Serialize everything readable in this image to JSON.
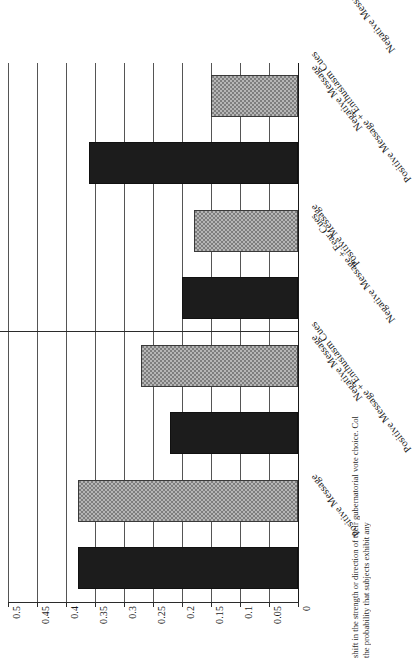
{
  "figure": {
    "caption_fragment_top": "shift in the strength or direction of their gubernatorial vote choice. Col",
    "caption_fragment_bottom": "the probability that subjects exhibit any"
  },
  "axis": {
    "y_title_line1": "Probability of Shifting Vote Preference",
    "y_title_line2": "or Expressing Certainty in Vote Choice",
    "tick_labels": [
      "0.5",
      "0.45",
      "0.4",
      "0.35",
      "0.3",
      "0.25",
      "0.2",
      "0.15",
      "0.1",
      "0.05",
      "0"
    ]
  },
  "panels": [
    {
      "title": "Any Shift in Vote Choice"
    },
    {
      "title": "Self-Reported Certainty in Vote Choice"
    }
  ],
  "categories": [
    "Positive Message",
    "Positive Message + Enthusiasm Cues",
    "Negative Message",
    "Negative Message + Fear Cues"
  ],
  "colors": {
    "dark_bar": "#1c1c1c",
    "light_bar": "#b6b6b6",
    "axis": "#2b2b2b",
    "grid": "#555555"
  },
  "chart_data": {
    "type": "bar",
    "title": "",
    "xlabel": "",
    "ylabel": "Probability of Shifting Vote Preference or Expressing Certainty in Vote Choice",
    "ylim": [
      0,
      0.5
    ],
    "ytick_values": [
      0,
      0.05,
      0.1,
      0.15,
      0.2,
      0.25,
      0.3,
      0.35,
      0.4,
      0.45,
      0.5
    ],
    "grid": true,
    "legend": "none",
    "orientation": "vertical-bars-in-rotated-scan",
    "categories": [
      "Positive Message",
      "Positive Message + Enthusiasm Cues",
      "Negative Message",
      "Negative Message + Fear Cues"
    ],
    "panels": [
      {
        "name": "Any Shift in Vote Choice",
        "values": [
          0.38,
          0.38,
          0.22,
          0.27
        ],
        "fills": [
          "dark",
          "light",
          "dark",
          "light"
        ]
      },
      {
        "name": "Self-Reported Certainty in Vote Choice",
        "values": [
          0.2,
          0.18,
          0.36,
          0.15
        ],
        "fills": [
          "dark",
          "light",
          "dark",
          "light"
        ]
      }
    ]
  }
}
